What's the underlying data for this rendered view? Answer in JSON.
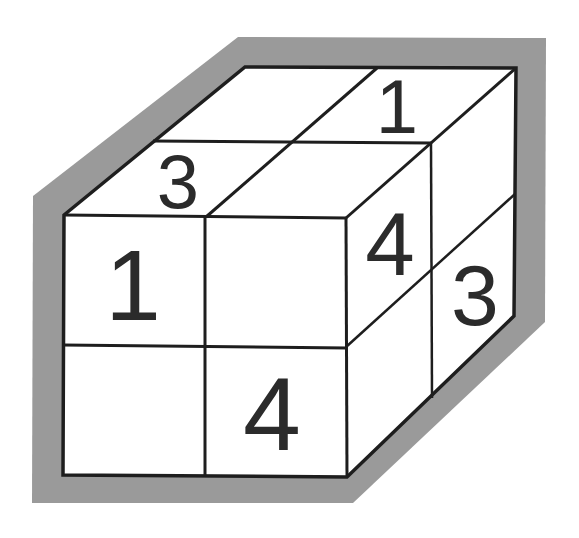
{
  "colors": {
    "background": "#ffffff",
    "shadow": "#9a9a9a",
    "line": "#1e1e1e",
    "face": "#ffffff",
    "digit": "#2b2b2b"
  },
  "puzzle": {
    "description": "2x2x2 cube puzzle with numbers on visible faces",
    "top_face": {
      "cells": [
        {
          "position": "back-left",
          "value": ""
        },
        {
          "position": "back-right",
          "value": "1"
        },
        {
          "position": "front-left",
          "value": "3"
        },
        {
          "position": "front-right",
          "value": ""
        }
      ]
    },
    "front_face": {
      "cells": [
        {
          "position": "top-left",
          "value": "1"
        },
        {
          "position": "top-right",
          "value": ""
        },
        {
          "position": "bottom-left",
          "value": ""
        },
        {
          "position": "bottom-right",
          "value": "4"
        }
      ]
    },
    "right_face": {
      "cells": [
        {
          "position": "top-front",
          "value": "4"
        },
        {
          "position": "top-back",
          "value": ""
        },
        {
          "position": "bottom-front",
          "value": ""
        },
        {
          "position": "bottom-back",
          "value": "3"
        }
      ]
    }
  },
  "labels": {
    "top_back_right": "1",
    "top_front_left": "3",
    "front_top_left": "1",
    "front_bottom_right": "4",
    "right_top_front": "4",
    "right_bottom_back": "3"
  }
}
